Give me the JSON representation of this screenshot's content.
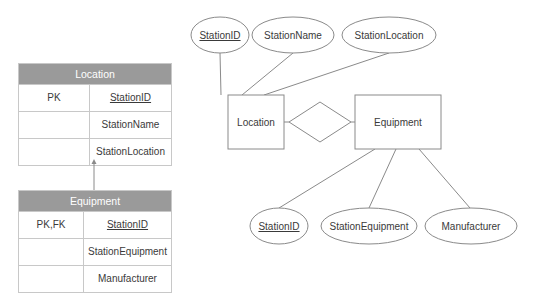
{
  "relational_tables": [
    {
      "name": "Location",
      "rows": [
        {
          "key": "PK",
          "field": "StationID",
          "underline": true
        },
        {
          "key": "",
          "field": "StationName",
          "underline": false
        },
        {
          "key": "",
          "field": "StationLocation",
          "underline": false
        }
      ]
    },
    {
      "name": "Equipment",
      "rows": [
        {
          "key": "PK,FK",
          "field": "StationID",
          "underline": true
        },
        {
          "key": "",
          "field": "StationEquipment",
          "underline": false
        },
        {
          "key": "",
          "field": "Manufacturer",
          "underline": false
        }
      ]
    }
  ],
  "er_diagram": {
    "entities": [
      {
        "name": "Location"
      },
      {
        "name": "Equipment"
      }
    ],
    "relationship": {
      "label": ""
    },
    "location_attributes": [
      "StationID",
      "StationName",
      "StationLocation"
    ],
    "equipment_attributes": [
      "StationID",
      "StationEquipment",
      "Manufacturer"
    ]
  },
  "colors": {
    "header_bg": "#9a9a9a",
    "line": "#8a8a8a",
    "border": "#c8c8c8"
  }
}
